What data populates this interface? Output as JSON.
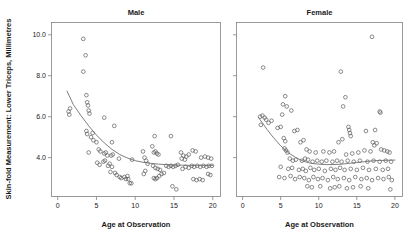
{
  "figure": {
    "xlabel": "Age at Observation",
    "ylabel": "Skin-fold Measurement: Lower Triceps, Millimetres",
    "panel_titles": [
      "Male",
      "Female"
    ],
    "marker_color": "#5a5a5a",
    "line_color": "#6e6e6e",
    "frame_color": "#808080",
    "background": "#ffffff"
  },
  "axes": {
    "x_ticks": [
      "0",
      "5",
      "10",
      "15",
      "20"
    ],
    "y_ticks": [
      "4.0",
      "6.0",
      "8.0",
      "10.0"
    ]
  },
  "chart_data": {
    "type": "scatter",
    "title": "",
    "xlabel": "Age at Observation",
    "ylabel": "Skin-fold Measurement: Lower Triceps, Millimetres",
    "xlim": [
      -0.8,
      21.0
    ],
    "ylim": [
      2.1,
      10.6
    ],
    "xticks": [
      0,
      5,
      10,
      15,
      20
    ],
    "yticks": [
      4.0,
      6.0,
      8.0,
      10.0
    ],
    "grid": false,
    "legend": "none",
    "panel_layout": "1x2",
    "panels": [
      {
        "name": "Male",
        "points": [
          [
            3.3,
            9.8
          ],
          [
            3.6,
            9.0
          ],
          [
            3.3,
            8.2
          ],
          [
            3.7,
            7.05
          ],
          [
            1.4,
            6.25
          ],
          [
            1.6,
            6.4
          ],
          [
            1.5,
            6.1
          ],
          [
            3.8,
            6.7
          ],
          [
            3.9,
            6.55
          ],
          [
            4.0,
            6.3
          ],
          [
            4.1,
            6.15
          ],
          [
            6.0,
            5.95
          ],
          [
            7.3,
            5.55
          ],
          [
            3.7,
            5.3
          ],
          [
            3.8,
            5.15
          ],
          [
            4.5,
            5.2
          ],
          [
            4.3,
            5.0
          ],
          [
            4.6,
            4.85
          ],
          [
            5.0,
            4.75
          ],
          [
            7.0,
            4.75
          ],
          [
            4.0,
            4.25
          ],
          [
            5.3,
            4.4
          ],
          [
            5.5,
            4.3
          ],
          [
            6.0,
            4.2
          ],
          [
            6.2,
            4.25
          ],
          [
            6.4,
            4.1
          ],
          [
            6.9,
            4.1
          ],
          [
            7.1,
            4.15
          ],
          [
            5.1,
            3.75
          ],
          [
            5.4,
            3.65
          ],
          [
            5.9,
            3.8
          ],
          [
            6.1,
            3.85
          ],
          [
            6.5,
            3.6
          ],
          [
            6.7,
            3.7
          ],
          [
            7.0,
            3.55
          ],
          [
            6.8,
            3.3
          ],
          [
            7.4,
            3.25
          ],
          [
            7.6,
            3.15
          ],
          [
            8.0,
            3.05
          ],
          [
            8.2,
            3.0
          ],
          [
            8.6,
            3.05
          ],
          [
            8.8,
            2.95
          ],
          [
            9.0,
            3.1
          ],
          [
            9.1,
            2.95
          ],
          [
            9.3,
            2.75
          ],
          [
            9.5,
            2.75
          ],
          [
            7.9,
            3.95
          ],
          [
            9.6,
            3.9
          ],
          [
            11.0,
            4.3
          ],
          [
            11.2,
            4.0
          ],
          [
            11.4,
            3.85
          ],
          [
            11.6,
            3.7
          ],
          [
            11.1,
            3.2
          ],
          [
            11.3,
            3.35
          ],
          [
            12.4,
            4.25
          ],
          [
            12.6,
            4.3
          ],
          [
            12.8,
            4.2
          ],
          [
            13.0,
            4.15
          ],
          [
            12.2,
            4.55
          ],
          [
            12.5,
            5.05
          ],
          [
            14.6,
            5.05
          ],
          [
            12.3,
            3.6
          ],
          [
            12.6,
            3.5
          ],
          [
            12.9,
            3.45
          ],
          [
            13.2,
            3.4
          ],
          [
            12.4,
            3.0
          ],
          [
            12.6,
            2.95
          ],
          [
            12.8,
            3.0
          ],
          [
            13.1,
            3.1
          ],
          [
            13.4,
            3.2
          ],
          [
            13.7,
            3.25
          ],
          [
            14.0,
            3.6
          ],
          [
            14.3,
            3.55
          ],
          [
            14.6,
            3.6
          ],
          [
            14.9,
            3.55
          ],
          [
            15.2,
            3.6
          ],
          [
            15.5,
            3.65
          ],
          [
            14.8,
            2.6
          ],
          [
            15.3,
            2.45
          ],
          [
            15.9,
            4.25
          ],
          [
            16.2,
            4.1
          ],
          [
            16.6,
            4.05
          ],
          [
            16.9,
            4.15
          ],
          [
            16.0,
            3.95
          ],
          [
            16.4,
            3.9
          ],
          [
            16.1,
            3.45
          ],
          [
            16.5,
            3.55
          ],
          [
            16.9,
            3.5
          ],
          [
            17.4,
            4.35
          ],
          [
            17.8,
            4.3
          ],
          [
            17.3,
            3.6
          ],
          [
            17.6,
            3.55
          ],
          [
            18.0,
            3.6
          ],
          [
            18.4,
            3.55
          ],
          [
            18.8,
            3.6
          ],
          [
            19.2,
            3.55
          ],
          [
            19.5,
            3.6
          ],
          [
            17.5,
            2.95
          ],
          [
            17.9,
            2.9
          ],
          [
            18.3,
            2.95
          ],
          [
            18.7,
            2.9
          ],
          [
            19.4,
            3.2
          ],
          [
            19.7,
            3.15
          ],
          [
            18.5,
            4.0
          ],
          [
            19.0,
            4.05
          ],
          [
            19.4,
            4.0
          ],
          [
            19.8,
            3.95
          ],
          [
            19.9,
            3.6
          ]
        ],
        "smooth": [
          [
            1.2,
            7.25
          ],
          [
            2.0,
            6.6
          ],
          [
            3.0,
            6.05
          ],
          [
            4.0,
            5.55
          ],
          [
            5.0,
            5.1
          ],
          [
            6.0,
            4.72
          ],
          [
            7.0,
            4.4
          ],
          [
            8.0,
            4.15
          ],
          [
            9.0,
            3.98
          ],
          [
            10.0,
            3.85
          ],
          [
            11.0,
            3.77
          ],
          [
            12.0,
            3.72
          ],
          [
            13.0,
            3.68
          ],
          [
            14.0,
            3.66
          ],
          [
            15.0,
            3.64
          ],
          [
            16.0,
            3.63
          ],
          [
            17.0,
            3.62
          ],
          [
            18.0,
            3.62
          ],
          [
            19.0,
            3.62
          ],
          [
            20.0,
            3.62
          ]
        ]
      },
      {
        "name": "Female",
        "points": [
          [
            2.7,
            8.4
          ],
          [
            17.0,
            9.9
          ],
          [
            12.9,
            8.2
          ],
          [
            5.6,
            7.0
          ],
          [
            13.5,
            6.95
          ],
          [
            5.3,
            6.6
          ],
          [
            5.8,
            6.5
          ],
          [
            13.2,
            6.5
          ],
          [
            2.3,
            6.0
          ],
          [
            2.6,
            6.05
          ],
          [
            2.9,
            5.95
          ],
          [
            3.1,
            5.85
          ],
          [
            5.2,
            6.1
          ],
          [
            6.4,
            6.3
          ],
          [
            18.0,
            6.25
          ],
          [
            18.1,
            6.2
          ],
          [
            2.4,
            5.6
          ],
          [
            3.4,
            5.7
          ],
          [
            3.8,
            5.8
          ],
          [
            4.6,
            5.45
          ],
          [
            5.0,
            5.5
          ],
          [
            6.8,
            5.3
          ],
          [
            7.2,
            5.35
          ],
          [
            13.9,
            5.5
          ],
          [
            14.0,
            5.35
          ],
          [
            14.1,
            5.2
          ],
          [
            14.2,
            5.05
          ],
          [
            16.2,
            5.3
          ],
          [
            17.4,
            5.35
          ],
          [
            5.4,
            4.95
          ],
          [
            5.6,
            4.8
          ],
          [
            7.6,
            4.75
          ],
          [
            8.0,
            4.85
          ],
          [
            12.6,
            4.75
          ],
          [
            13.1,
            4.9
          ],
          [
            17.1,
            4.75
          ],
          [
            17.3,
            4.6
          ],
          [
            17.6,
            4.7
          ],
          [
            5.5,
            4.45
          ],
          [
            5.7,
            4.35
          ],
          [
            5.9,
            4.25
          ],
          [
            8.4,
            4.4
          ],
          [
            8.8,
            4.3
          ],
          [
            9.6,
            4.25
          ],
          [
            10.6,
            4.3
          ],
          [
            11.4,
            4.25
          ],
          [
            12.0,
            4.3
          ],
          [
            13.6,
            4.15
          ],
          [
            14.4,
            4.2
          ],
          [
            15.2,
            4.25
          ],
          [
            16.0,
            4.35
          ],
          [
            16.8,
            4.3
          ],
          [
            18.2,
            4.4
          ],
          [
            18.6,
            4.35
          ],
          [
            19.0,
            4.3
          ],
          [
            19.3,
            4.25
          ],
          [
            6.2,
            3.95
          ],
          [
            6.6,
            3.85
          ],
          [
            7.0,
            3.9
          ],
          [
            7.8,
            3.85
          ],
          [
            8.2,
            3.95
          ],
          [
            8.6,
            3.9
          ],
          [
            9.2,
            3.8
          ],
          [
            9.8,
            3.85
          ],
          [
            10.4,
            3.8
          ],
          [
            11.0,
            3.85
          ],
          [
            11.8,
            3.8
          ],
          [
            12.4,
            3.85
          ],
          [
            13.0,
            3.8
          ],
          [
            13.8,
            3.85
          ],
          [
            14.6,
            3.8
          ],
          [
            15.4,
            3.85
          ],
          [
            16.4,
            3.8
          ],
          [
            17.2,
            3.85
          ],
          [
            18.0,
            3.8
          ],
          [
            18.8,
            3.85
          ],
          [
            19.5,
            3.8
          ],
          [
            5.0,
            3.55
          ],
          [
            6.0,
            3.45
          ],
          [
            6.5,
            3.5
          ],
          [
            7.4,
            3.4
          ],
          [
            7.9,
            3.45
          ],
          [
            8.3,
            3.35
          ],
          [
            8.9,
            3.5
          ],
          [
            9.4,
            3.4
          ],
          [
            10.0,
            3.45
          ],
          [
            10.8,
            3.35
          ],
          [
            11.6,
            3.45
          ],
          [
            12.2,
            3.4
          ],
          [
            12.8,
            3.5
          ],
          [
            13.4,
            3.4
          ],
          [
            14.2,
            3.45
          ],
          [
            15.0,
            3.4
          ],
          [
            15.8,
            3.5
          ],
          [
            16.6,
            3.4
          ],
          [
            17.5,
            3.45
          ],
          [
            18.4,
            3.4
          ],
          [
            19.1,
            3.45
          ],
          [
            4.8,
            3.05
          ],
          [
            5.5,
            3.0
          ],
          [
            6.3,
            3.1
          ],
          [
            6.9,
            2.95
          ],
          [
            7.5,
            3.05
          ],
          [
            8.1,
            3.0
          ],
          [
            8.7,
            2.9
          ],
          [
            9.3,
            3.05
          ],
          [
            9.9,
            2.95
          ],
          [
            10.5,
            3.0
          ],
          [
            11.2,
            2.9
          ],
          [
            11.9,
            3.05
          ],
          [
            12.5,
            2.95
          ],
          [
            13.3,
            3.0
          ],
          [
            14.0,
            2.9
          ],
          [
            14.8,
            3.05
          ],
          [
            15.6,
            2.95
          ],
          [
            16.3,
            3.0
          ],
          [
            17.0,
            2.9
          ],
          [
            17.8,
            3.0
          ],
          [
            18.5,
            2.95
          ],
          [
            19.2,
            3.05
          ],
          [
            19.6,
            2.9
          ],
          [
            8.5,
            2.6
          ],
          [
            9.1,
            2.55
          ],
          [
            10.2,
            2.6
          ],
          [
            11.5,
            2.5
          ],
          [
            12.1,
            2.55
          ],
          [
            12.7,
            2.6
          ],
          [
            13.7,
            2.5
          ],
          [
            14.5,
            2.55
          ],
          [
            15.5,
            2.6
          ],
          [
            16.5,
            2.5
          ],
          [
            19.4,
            2.45
          ]
        ],
        "smooth": [
          [
            2.1,
            5.95
          ],
          [
            2.6,
            5.7
          ],
          [
            3.2,
            5.38
          ],
          [
            4.0,
            5.0
          ],
          [
            5.0,
            4.58
          ],
          [
            6.0,
            4.24
          ],
          [
            7.0,
            4.0
          ],
          [
            8.0,
            3.82
          ],
          [
            9.0,
            3.72
          ],
          [
            10.0,
            3.68
          ],
          [
            11.0,
            3.66
          ],
          [
            12.0,
            3.66
          ],
          [
            13.0,
            3.68
          ],
          [
            14.0,
            3.72
          ],
          [
            15.0,
            3.76
          ],
          [
            16.0,
            3.8
          ],
          [
            17.0,
            3.84
          ],
          [
            18.0,
            3.86
          ],
          [
            19.0,
            3.87
          ],
          [
            20.0,
            3.88
          ]
        ]
      }
    ]
  }
}
